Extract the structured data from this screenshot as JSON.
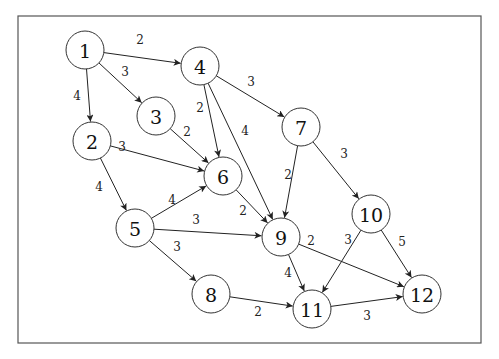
{
  "diagram": {
    "type": "directed-weighted-graph",
    "frame": {
      "x": 18,
      "y": 16,
      "width": 463,
      "height": 327
    },
    "node_radius": 19,
    "colors": {
      "stroke": "#222222",
      "background": "#ffffff",
      "text": "#111111"
    },
    "nodes": [
      {
        "id": "1",
        "label": "1",
        "x": 85,
        "y": 50
      },
      {
        "id": "2",
        "label": "2",
        "x": 92,
        "y": 141
      },
      {
        "id": "3",
        "label": "3",
        "x": 156,
        "y": 116
      },
      {
        "id": "4",
        "label": "4",
        "x": 200,
        "y": 66
      },
      {
        "id": "5",
        "label": "5",
        "x": 135,
        "y": 228
      },
      {
        "id": "6",
        "label": "6",
        "x": 223,
        "y": 176
      },
      {
        "id": "7",
        "label": "7",
        "x": 301,
        "y": 127
      },
      {
        "id": "8",
        "label": "8",
        "x": 211,
        "y": 294
      },
      {
        "id": "9",
        "label": "9",
        "x": 281,
        "y": 237
      },
      {
        "id": "10",
        "label": "10",
        "x": 371,
        "y": 214
      },
      {
        "id": "11",
        "label": "11",
        "x": 312,
        "y": 309
      },
      {
        "id": "12",
        "label": "12",
        "x": 422,
        "y": 294
      }
    ],
    "edges": [
      {
        "from": "1",
        "to": "4",
        "weight": "2",
        "lx": 140,
        "ly": 40
      },
      {
        "from": "1",
        "to": "3",
        "weight": "3",
        "lx": 125,
        "ly": 72
      },
      {
        "from": "1",
        "to": "2",
        "weight": "4",
        "lx": 77,
        "ly": 96
      },
      {
        "from": "4",
        "to": "7",
        "weight": "3",
        "lx": 251,
        "ly": 82
      },
      {
        "from": "4",
        "to": "6",
        "weight": "2",
        "lx": 200,
        "ly": 108
      },
      {
        "from": "4",
        "to": "9",
        "weight": "4",
        "lx": 245,
        "ly": 131
      },
      {
        "from": "3",
        "to": "6",
        "weight": "2",
        "lx": 187,
        "ly": 132
      },
      {
        "from": "2",
        "to": "6",
        "weight": "3",
        "lx": 122,
        "ly": 147
      },
      {
        "from": "2",
        "to": "5",
        "weight": "4",
        "lx": 99,
        "ly": 187
      },
      {
        "from": "7",
        "to": "9",
        "weight": "2",
        "lx": 288,
        "ly": 175
      },
      {
        "from": "7",
        "to": "10",
        "weight": "3",
        "lx": 344,
        "ly": 154
      },
      {
        "from": "6",
        "to": "9",
        "weight": "2",
        "lx": 243,
        "ly": 211
      },
      {
        "from": "5",
        "to": "6",
        "weight": "4",
        "lx": 172,
        "ly": 200
      },
      {
        "from": "5",
        "to": "9",
        "weight": "3",
        "lx": 196,
        "ly": 220
      },
      {
        "from": "5",
        "to": "8",
        "weight": "3",
        "lx": 177,
        "ly": 247
      },
      {
        "from": "9",
        "to": "11",
        "weight": "4",
        "lx": 288,
        "ly": 273
      },
      {
        "from": "9",
        "to": "12",
        "weight": "2",
        "lx": 311,
        "ly": 241
      },
      {
        "from": "10",
        "to": "11",
        "weight": "3",
        "lx": 348,
        "ly": 240
      },
      {
        "from": "10",
        "to": "12",
        "weight": "5",
        "lx": 402,
        "ly": 242
      },
      {
        "from": "8",
        "to": "11",
        "weight": "2",
        "lx": 258,
        "ly": 312
      },
      {
        "from": "11",
        "to": "12",
        "weight": "3",
        "lx": 367,
        "ly": 316
      }
    ]
  }
}
